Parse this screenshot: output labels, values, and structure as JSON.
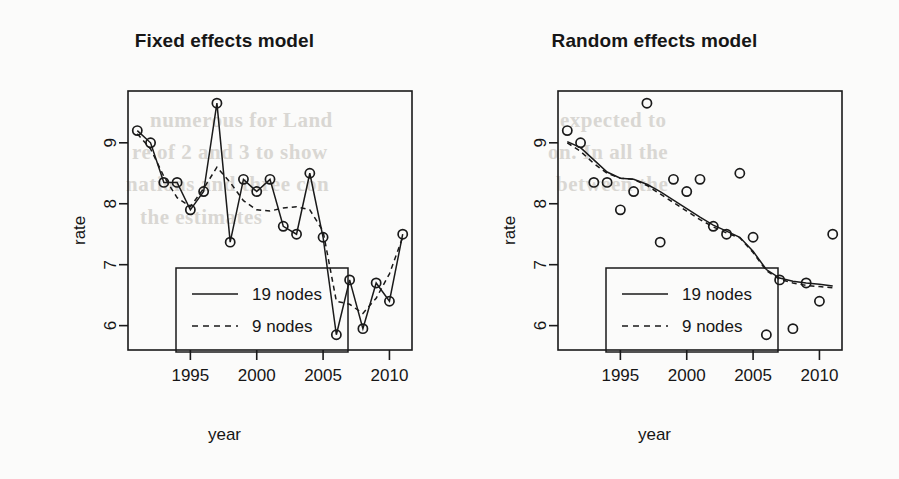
{
  "background_color": "#fbfbfa",
  "ink_color": "#1a1a1a",
  "bleed_text": [
    {
      "text": "numerous for Land",
      "x": 150,
      "y": 108
    },
    {
      "text": "re of 2 and 3 to show",
      "x": 132,
      "y": 140
    },
    {
      "text": "nations and three con",
      "x": 126,
      "y": 172
    },
    {
      "text": "the estimates",
      "x": 140,
      "y": 205
    },
    {
      "text": "expected to",
      "x": 560,
      "y": 108
    },
    {
      "text": "on. In all the",
      "x": 548,
      "y": 140
    },
    {
      "text": "between the",
      "x": 556,
      "y": 172
    }
  ],
  "panels": [
    {
      "id": "fixed",
      "title": "Fixed effects model",
      "xlabel": "year",
      "ylabel": "rate"
    },
    {
      "id": "random",
      "title": "Random effects model",
      "xlabel": "year",
      "ylabel": "rate"
    }
  ],
  "legend": {
    "entries": [
      {
        "label": "19 nodes",
        "style": "solid"
      },
      {
        "label": "9 nodes",
        "style": "dashed"
      }
    ]
  },
  "chart_data": {
    "type": "line",
    "xlabel": "year",
    "ylabel": "rate",
    "xlim": [
      1990.3,
      2011.7
    ],
    "ylim": [
      5.6,
      9.85
    ],
    "xticks": [
      1995,
      2000,
      2005,
      2010
    ],
    "yticks": [
      6,
      7,
      8,
      9
    ],
    "grid": false,
    "legend_position": "bottom-left",
    "x": [
      1991,
      1992,
      1993,
      1994,
      1995,
      1996,
      1997,
      1998,
      1999,
      2000,
      2001,
      2002,
      2003,
      2004,
      2005,
      2006,
      2007,
      2008,
      2009,
      2010,
      2011
    ],
    "observed": {
      "name": "observed rate",
      "marker": "open-circle",
      "values": [
        9.2,
        9.0,
        8.35,
        8.35,
        7.9,
        8.2,
        9.65,
        7.37,
        8.4,
        8.2,
        8.4,
        7.63,
        7.5,
        8.5,
        7.45,
        5.85,
        6.75,
        5.95,
        6.7,
        6.4,
        7.5
      ]
    },
    "panels": [
      {
        "id": "fixed",
        "title": "Fixed effects model",
        "series": [
          {
            "name": "19 nodes",
            "style": "solid",
            "values": [
              9.2,
              9.0,
              8.35,
              8.35,
              7.9,
              8.2,
              9.65,
              7.37,
              8.4,
              8.2,
              8.4,
              7.63,
              7.5,
              8.5,
              7.45,
              5.85,
              6.75,
              5.95,
              6.7,
              6.4,
              7.5
            ]
          },
          {
            "name": "9 nodes",
            "style": "dashed",
            "values": [
              9.15,
              8.9,
              8.45,
              8.1,
              7.95,
              8.25,
              8.6,
              8.35,
              8.05,
              7.9,
              7.88,
              7.93,
              7.95,
              7.9,
              7.55,
              6.4,
              6.35,
              6.2,
              6.45,
              6.85,
              7.45
            ]
          }
        ]
      },
      {
        "id": "random",
        "title": "Random effects model",
        "series": [
          {
            "name": "19 nodes",
            "style": "solid",
            "values": [
              9.02,
              8.92,
              8.72,
              8.52,
              8.42,
              8.4,
              8.32,
              8.2,
              8.06,
              7.92,
              7.78,
              7.65,
              7.55,
              7.45,
              7.22,
              6.92,
              6.78,
              6.73,
              6.7,
              6.68,
              6.65
            ]
          },
          {
            "name": "9 nodes",
            "style": "dashed",
            "values": [
              9.0,
              8.86,
              8.66,
              8.5,
              8.42,
              8.4,
              8.3,
              8.16,
              8.02,
              7.88,
              7.74,
              7.62,
              7.52,
              7.44,
              7.2,
              6.9,
              6.76,
              6.7,
              6.66,
              6.64,
              6.62
            ]
          }
        ]
      }
    ]
  }
}
